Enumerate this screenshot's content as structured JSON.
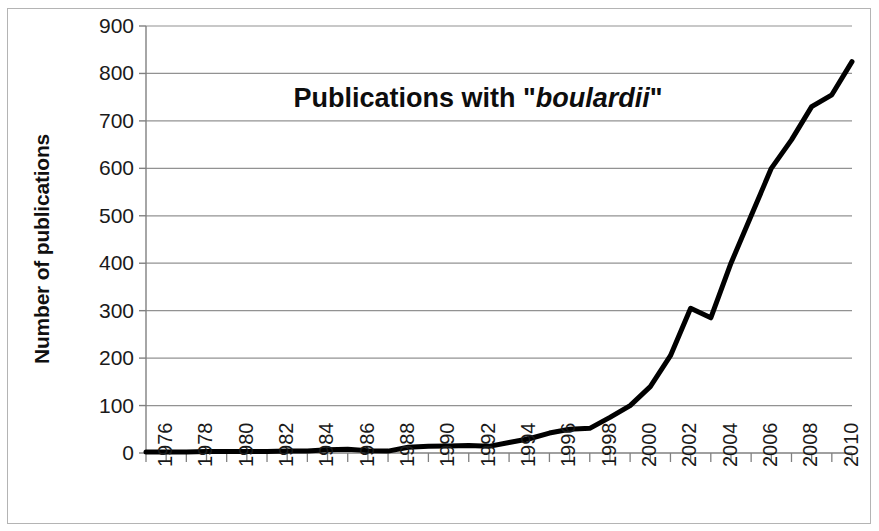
{
  "chart_data": {
    "type": "line",
    "title": "Publications with \"boulardii\"",
    "title_plain": "Publications with ",
    "title_italic": "boulardii",
    "title_quote_open": "\"",
    "title_quote_close": "\"",
    "xlabel": "",
    "ylabel": "Number of publications",
    "ylim": [
      0,
      900
    ],
    "ytick_step": 100,
    "yticks": [
      900,
      800,
      700,
      600,
      500,
      400,
      300,
      200,
      100,
      0
    ],
    "xlim": [
      1976,
      2011
    ],
    "xtick_labels": [
      "1976",
      "1978",
      "1980",
      "1982",
      "1984",
      "1986",
      "1988",
      "1990",
      "1992",
      "1994",
      "1996",
      "1998",
      "2000",
      "2002",
      "2004",
      "2006",
      "2008",
      "2010"
    ],
    "xtick_label_step": 2,
    "grid": "horizontal",
    "legend": "none",
    "line_color": "#000000",
    "line_width": 5,
    "gridline_color": "#808080",
    "x": [
      1976,
      1977,
      1978,
      1979,
      1980,
      1981,
      1982,
      1983,
      1984,
      1985,
      1986,
      1987,
      1988,
      1989,
      1990,
      1991,
      1992,
      1993,
      1994,
      1995,
      1996,
      1997,
      1998,
      1999,
      2000,
      2001,
      2002,
      2003,
      2004,
      2005,
      2006,
      2007,
      2008,
      2009,
      2010,
      2011
    ],
    "values": [
      2,
      2,
      2,
      3,
      3,
      3,
      3,
      4,
      4,
      7,
      8,
      5,
      4,
      12,
      14,
      15,
      16,
      14,
      22,
      30,
      42,
      50,
      52,
      75,
      100,
      140,
      205,
      305,
      285,
      400,
      500,
      600,
      660,
      730,
      755,
      825
    ],
    "series": [
      {
        "name": "Publications with boulardii",
        "values": [
          2,
          2,
          2,
          3,
          3,
          3,
          3,
          4,
          4,
          7,
          8,
          5,
          4,
          12,
          14,
          15,
          16,
          14,
          22,
          30,
          42,
          50,
          52,
          75,
          100,
          140,
          205,
          305,
          285,
          400,
          500,
          600,
          660,
          730,
          755,
          825
        ]
      }
    ]
  },
  "axes": {
    "y_title": "Number of publications"
  }
}
